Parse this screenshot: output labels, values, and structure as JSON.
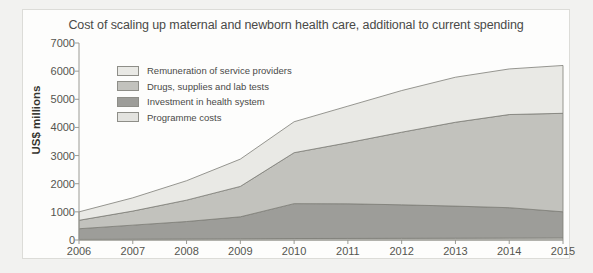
{
  "chart_data": {
    "type": "area",
    "title": "Cost of scaling up maternal and newborn health care, additional to current spending",
    "xlabel": "",
    "ylabel": "US$ millions",
    "categories": [
      "2006",
      "2007",
      "2008",
      "2009",
      "2010",
      "2011",
      "2012",
      "2013",
      "2014",
      "2015"
    ],
    "x": [
      2006,
      2007,
      2008,
      2009,
      2010,
      2011,
      2012,
      2013,
      2014,
      2015
    ],
    "ylim": [
      0,
      7000
    ],
    "yticks": [
      0,
      1000,
      2000,
      3000,
      4000,
      5000,
      6000,
      7000
    ],
    "grid": false,
    "stacked": true,
    "legend_position": "top-left",
    "series": [
      {
        "name": "Programme costs",
        "color": "#e3e3df",
        "values": [
          20,
          28,
          36,
          44,
          52,
          56,
          60,
          64,
          68,
          72
        ]
      },
      {
        "name": "Investment in health system",
        "color": "#9d9d99",
        "values": [
          380,
          500,
          620,
          780,
          1240,
          1230,
          1190,
          1140,
          1080,
          930
        ]
      },
      {
        "name": "Drugs, supplies and lab tests",
        "color": "#c2c2bd",
        "values": [
          300,
          500,
          760,
          1080,
          1810,
          2170,
          2580,
          2980,
          3310,
          3500
        ]
      },
      {
        "name": "Remuneration of service providers",
        "color": "#e9e9e5",
        "values": [
          300,
          470,
          690,
          970,
          1100,
          1300,
          1480,
          1600,
          1620,
          1700
        ]
      }
    ],
    "totals": [
      1000,
      1500,
      2100,
      2880,
      4200,
      4760,
      5310,
      5780,
      6080,
      6200
    ]
  },
  "legend": {
    "items": [
      {
        "label": "Remuneration of service providers",
        "color": "#e9e9e5"
      },
      {
        "label": "Drugs, supplies and lab tests",
        "color": "#c2c2bd"
      },
      {
        "label": "Investment in health system",
        "color": "#9d9d99"
      },
      {
        "label": "Programme costs",
        "color": "#e3e3df"
      }
    ]
  }
}
